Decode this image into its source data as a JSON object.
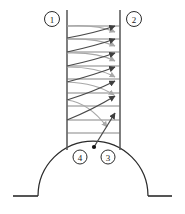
{
  "figure": {
    "type": "line-diagram",
    "background_color": "#ffffff",
    "stroke_dark": "#4a4a4a",
    "stroke_light": "#a8a8a8",
    "stroke_black": "#1b1b1b",
    "callouts": [
      {
        "id": "callout-1",
        "label": "1",
        "cx": 52,
        "cy": 19,
        "r": 7.5
      },
      {
        "id": "callout-2",
        "label": "2",
        "cx": 134,
        "cy": 19,
        "r": 7.5
      },
      {
        "id": "callout-3",
        "label": "3",
        "cx": 108,
        "cy": 157,
        "r": 7.0
      },
      {
        "id": "callout-4",
        "label": "4",
        "cx": 80,
        "cy": 157,
        "r": 7.0
      }
    ],
    "channel": {
      "left_wall_x": 67,
      "right_wall_x": 120,
      "top_y": 10,
      "bottom_y": 150
    },
    "dome": {
      "center_x": 93,
      "center_y": 196,
      "radius": 55,
      "apex_dot_x": 94,
      "apex_dot_y": 147,
      "apex_dot_r": 2.0
    },
    "baseline": {
      "y": 196,
      "left_start_x": 13,
      "left_end_x": 38,
      "right_start_x": 148,
      "right_end_x": 172
    },
    "horizontal_rules_y": [
      26,
      39,
      52,
      66,
      79,
      93,
      106,
      120,
      133
    ],
    "dark_rays": [
      {
        "start_x": 67,
        "start_y": 38,
        "end_x": 118,
        "end_y": 26
      },
      {
        "start_x": 67,
        "start_y": 52,
        "end_x": 118,
        "end_y": 39
      },
      {
        "start_x": 67,
        "start_y": 66,
        "end_x": 118,
        "end_y": 53
      },
      {
        "start_x": 67,
        "start_y": 82,
        "end_x": 118,
        "end_y": 67
      },
      {
        "start_x": 67,
        "start_y": 100,
        "end_x": 118,
        "end_y": 81
      },
      {
        "start_x": 67,
        "start_y": 120,
        "end_x": 118,
        "end_y": 96
      },
      {
        "start_x": 94,
        "start_y": 147,
        "end_x": 118,
        "end_y": 113
      }
    ],
    "light_rays": [
      {
        "start_x": 67,
        "start_y": 26,
        "end_x": 118,
        "end_y": 33
      },
      {
        "start_x": 67,
        "start_y": 39,
        "end_x": 118,
        "end_y": 47
      },
      {
        "start_x": 67,
        "start_y": 53,
        "end_x": 118,
        "end_y": 62
      },
      {
        "start_x": 67,
        "start_y": 67,
        "end_x": 118,
        "end_y": 78
      },
      {
        "start_x": 67,
        "start_y": 82,
        "end_x": 118,
        "end_y": 96
      },
      {
        "start_x": 67,
        "start_y": 100,
        "end_x": 110,
        "end_y": 130
      }
    ]
  }
}
